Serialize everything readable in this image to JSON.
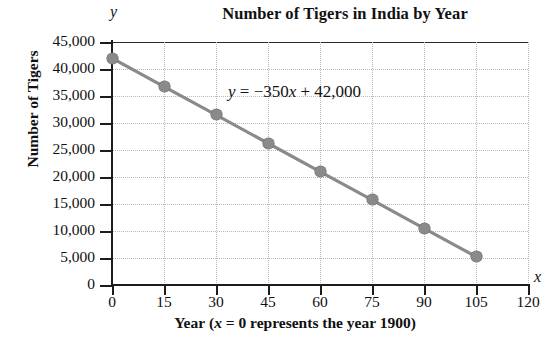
{
  "chart_data": {
    "type": "line",
    "title": "Number of Tigers in India by Year",
    "xlabel": "Year (x = 0 represents the year 1900)",
    "ylabel": "Number of Tigers",
    "x_axis_letter": "x",
    "y_axis_letter": "y",
    "xlim": [
      0,
      120
    ],
    "ylim": [
      0,
      45000
    ],
    "grid": true,
    "legend": "none",
    "annotation": "y = −350x + 42,000",
    "annotation_parts": {
      "y": "y",
      "eq": " = ",
      "slope": "−350",
      "x": "x",
      "intercept": " + 42,000"
    },
    "equation": {
      "slope": -350,
      "intercept": 42000
    },
    "x_ticks": [
      0,
      15,
      30,
      45,
      60,
      75,
      90,
      105,
      120
    ],
    "x_tick_labels": [
      "0",
      "15",
      "30",
      "45",
      "60",
      "75",
      "90",
      "105",
      "120"
    ],
    "y_ticks": [
      0,
      5000,
      10000,
      15000,
      20000,
      25000,
      30000,
      35000,
      40000,
      45000
    ],
    "y_tick_labels": [
      "0",
      "5,000",
      "10,000",
      "15,000",
      "20,000",
      "25,000",
      "30,000",
      "35,000",
      "40,000",
      "45,000"
    ],
    "x": [
      0,
      15,
      30,
      45,
      60,
      75,
      90,
      105
    ],
    "values": [
      42000,
      36750,
      31500,
      26250,
      21000,
      15750,
      10500,
      5250
    ],
    "series": [
      {
        "name": "Number of Tigers",
        "x": [
          0,
          15,
          30,
          45,
          60,
          75,
          90,
          105
        ],
        "values": [
          42000,
          36750,
          31500,
          26250,
          21000,
          15750,
          10500,
          5250
        ]
      }
    ],
    "colors": {
      "line": "#8a8a8a",
      "marker": "#8a8a8a",
      "grid": "#b9b9b9",
      "axis": "#1c1c1c",
      "background": "#ffffff",
      "text": "#111111"
    }
  }
}
